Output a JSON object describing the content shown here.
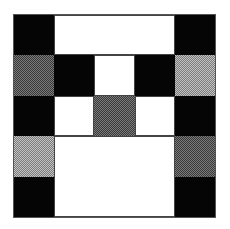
{
  "diagram": {
    "type": "grid-pattern",
    "rows": 5,
    "columns": 5,
    "colors": {
      "black": "#050505",
      "white": "#ffffff",
      "dark_gray": "#5a5a5a",
      "light_gray": "#9a9a9a"
    },
    "cells": [
      {
        "row": 1,
        "col": 1,
        "rowspan": 1,
        "colspan": 1,
        "fill": "black"
      },
      {
        "row": 1,
        "col": 2,
        "rowspan": 1,
        "colspan": 3,
        "fill": "white"
      },
      {
        "row": 1,
        "col": 5,
        "rowspan": 1,
        "colspan": 1,
        "fill": "black"
      },
      {
        "row": 2,
        "col": 1,
        "rowspan": 1,
        "colspan": 1,
        "fill": "dark_gray"
      },
      {
        "row": 2,
        "col": 2,
        "rowspan": 1,
        "colspan": 1,
        "fill": "black"
      },
      {
        "row": 2,
        "col": 3,
        "rowspan": 1,
        "colspan": 1,
        "fill": "white"
      },
      {
        "row": 2,
        "col": 4,
        "rowspan": 1,
        "colspan": 1,
        "fill": "black"
      },
      {
        "row": 2,
        "col": 5,
        "rowspan": 1,
        "colspan": 1,
        "fill": "light_gray"
      },
      {
        "row": 3,
        "col": 1,
        "rowspan": 1,
        "colspan": 1,
        "fill": "black"
      },
      {
        "row": 3,
        "col": 2,
        "rowspan": 1,
        "colspan": 1,
        "fill": "white"
      },
      {
        "row": 3,
        "col": 3,
        "rowspan": 1,
        "colspan": 1,
        "fill": "dark_gray"
      },
      {
        "row": 3,
        "col": 4,
        "rowspan": 1,
        "colspan": 1,
        "fill": "white"
      },
      {
        "row": 3,
        "col": 5,
        "rowspan": 1,
        "colspan": 1,
        "fill": "black"
      },
      {
        "row": 4,
        "col": 1,
        "rowspan": 1,
        "colspan": 1,
        "fill": "light_gray"
      },
      {
        "row": 4,
        "col": 2,
        "rowspan": 2,
        "colspan": 3,
        "fill": "white"
      },
      {
        "row": 4,
        "col": 5,
        "rowspan": 1,
        "colspan": 1,
        "fill": "dark_gray"
      },
      {
        "row": 5,
        "col": 1,
        "rowspan": 1,
        "colspan": 1,
        "fill": "black"
      },
      {
        "row": 5,
        "col": 5,
        "rowspan": 1,
        "colspan": 1,
        "fill": "black"
      }
    ]
  }
}
